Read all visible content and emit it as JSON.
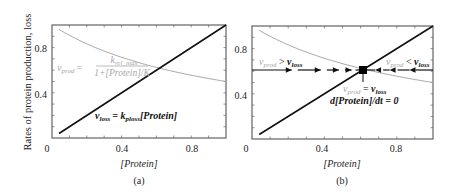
{
  "chart_data": [
    {
      "type": "line",
      "panel_label": "(a)",
      "xlabel": "[Protein]",
      "ylabel": "Rates of protein production, loss",
      "xlim": [
        0,
        1
      ],
      "ylim": [
        0,
        1
      ],
      "xticks": [
        0,
        0.4,
        0.8
      ],
      "yticks": [
        0.4,
        0.8
      ],
      "xtick_labels": [
        "0",
        "0.4",
        "0.8"
      ],
      "ytick_labels": [
        "0.4",
        "0.8"
      ],
      "grid": false,
      "series": [
        {
          "name": "v_prod",
          "formula": "v_prod = k_rel_max / (1 + [Protein]/K)",
          "color": "#a8a8a8",
          "x": [
            0.04,
            0.1,
            0.2,
            0.3,
            0.4,
            0.5,
            0.6,
            0.7,
            0.8,
            0.9,
            1.0
          ],
          "values": [
            0.96,
            0.91,
            0.83,
            0.77,
            0.71,
            0.67,
            0.63,
            0.59,
            0.56,
            0.53,
            0.5
          ]
        },
        {
          "name": "v_loss",
          "formula": "v_loss = k_ploss[Protein]",
          "color": "#111111",
          "x": [
            0.04,
            1.0
          ],
          "values": [
            0.04,
            1.0
          ]
        }
      ],
      "annotations": [
        {
          "text_parts": [
            "v",
            "prod",
            " = "
          ],
          "fraction_num": [
            "k",
            "rel_max"
          ],
          "fraction_den": "1+[Protein]/K",
          "color": "#a8a8a8"
        },
        {
          "text_parts": [
            "v",
            "loss",
            " = k",
            "ploss",
            "[Protein]"
          ],
          "color": "#111111"
        }
      ]
    },
    {
      "type": "line",
      "panel_label": "(b)",
      "xlabel": "[Protein]",
      "ylabel": "",
      "xlim": [
        0,
        1
      ],
      "ylim": [
        0,
        1
      ],
      "xticks": [
        0,
        0.4,
        0.8
      ],
      "yticks": [
        0.4,
        0.8
      ],
      "xtick_labels": [
        "0",
        "0.4",
        "0.8"
      ],
      "ytick_labels": [
        "0.4",
        "0.8"
      ],
      "grid": false,
      "series": [
        {
          "name": "v_prod",
          "color": "#a8a8a8",
          "x": [
            0.04,
            0.1,
            0.2,
            0.3,
            0.4,
            0.5,
            0.6,
            0.7,
            0.8,
            0.9,
            1.0
          ],
          "values": [
            0.96,
            0.91,
            0.83,
            0.77,
            0.71,
            0.67,
            0.63,
            0.59,
            0.56,
            0.53,
            0.5
          ]
        },
        {
          "name": "v_loss",
          "color": "#111111",
          "x": [
            0.04,
            1.0
          ],
          "values": [
            0.04,
            1.0
          ]
        }
      ],
      "steady_state": {
        "x": 0.618,
        "y": 0.618
      },
      "flow_arrows": {
        "y": 0.618,
        "right_pointing_x": [
          0.22,
          0.38,
          0.48,
          0.55
        ],
        "left_pointing_x": [
          0.68,
          0.76,
          0.87
        ]
      },
      "annotations": [
        {
          "label": "left",
          "text_parts": [
            "v",
            "prod",
            " > ",
            "v",
            "loss"
          ]
        },
        {
          "label": "right",
          "text_parts": [
            "v",
            "prod",
            " < ",
            "v",
            "loss"
          ]
        },
        {
          "label": "equal",
          "text_parts": [
            "v",
            "prod",
            " = ",
            "v",
            "loss"
          ]
        },
        {
          "label": "derivative",
          "text": "d[Protein]/dt = 0"
        }
      ]
    }
  ],
  "labels": {
    "ylabel": "Rates of protein production, loss",
    "a": {
      "xlabel": "[Protein]",
      "panel": "(a)",
      "x0": "0",
      "x04": "0.4",
      "x08": "0.8",
      "y04": "0.4",
      "y08": "0.8",
      "vprod_v": "v",
      "vprod_sub": "prod",
      "eq": "=",
      "frac_num_k": "k",
      "frac_num_sub": "rel_max",
      "frac_den": "1+[Protein]/K",
      "vloss_v": "v",
      "vloss_sub": "loss",
      "vloss_rhs_k": "= k",
      "vloss_rhs_sub": "ploss",
      "vloss_rhs_tail": "[Protein]"
    },
    "b": {
      "xlabel": "[Protein]",
      "panel": "(b)",
      "x0": "0",
      "x04": "0.4",
      "x08": "0.8",
      "y04": "0.4",
      "y08": "0.8",
      "gt_v1": "v",
      "gt_sub1": "prod",
      "gt_op": " > ",
      "gt_v2": "v",
      "gt_sub2": "loss",
      "lt_v1": "v",
      "lt_sub1": "prod",
      "lt_op": " < ",
      "lt_v2": "v",
      "lt_sub2": "loss",
      "eq_v1": "v",
      "eq_sub1": "prod",
      "eq_op": " = ",
      "eq_v2": "v",
      "eq_sub2": "loss",
      "deriv": "d[Protein]/dt = 0"
    }
  },
  "colors": {
    "production": "#a8a8a8",
    "loss": "#111111",
    "axes": "#333333"
  }
}
